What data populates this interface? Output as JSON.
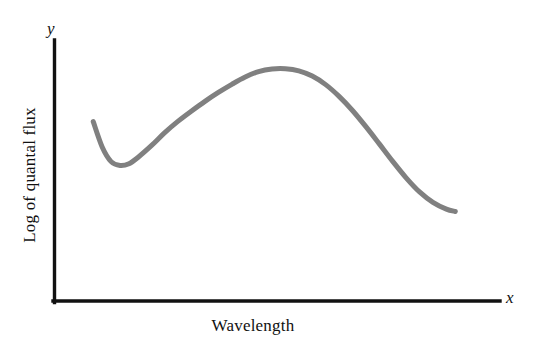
{
  "figure": {
    "background_color": "#ffffff",
    "axis_color": "#111111",
    "curve_color": "#808080"
  },
  "axes": {
    "y_variable": "y",
    "x_variable": "x"
  },
  "chart_data": {
    "type": "line",
    "title": "",
    "subtitle": "",
    "xlabel": "Wavelength",
    "ylabel": "Log of quantal flux",
    "xlim": [
      0,
      100
    ],
    "ylim": [
      0,
      100
    ],
    "grid": false,
    "legend": null,
    "axis_tick_labels": {
      "x": [],
      "y": []
    },
    "axis_variable_labels": {
      "x": "x",
      "y": "y"
    },
    "annotations": [],
    "series": [
      {
        "name": "Spectral quantal flux",
        "color": "#808080",
        "line_width": 5,
        "points": [
          {
            "x": 9.0,
            "y": 68.7
          },
          {
            "x": 11.0,
            "y": 59.0
          },
          {
            "x": 13.0,
            "y": 53.4
          },
          {
            "x": 15.0,
            "y": 51.9
          },
          {
            "x": 17.0,
            "y": 52.6
          },
          {
            "x": 19.0,
            "y": 55.0
          },
          {
            "x": 22.0,
            "y": 59.5
          },
          {
            "x": 25.0,
            "y": 64.5
          },
          {
            "x": 28.0,
            "y": 68.9
          },
          {
            "x": 31.0,
            "y": 72.8
          },
          {
            "x": 34.0,
            "y": 76.5
          },
          {
            "x": 37.0,
            "y": 79.9
          },
          {
            "x": 40.0,
            "y": 83.0
          },
          {
            "x": 43.0,
            "y": 85.8
          },
          {
            "x": 46.0,
            "y": 87.9
          },
          {
            "x": 49.0,
            "y": 88.9
          },
          {
            "x": 52.0,
            "y": 89.0
          },
          {
            "x": 55.0,
            "y": 88.2
          },
          {
            "x": 58.0,
            "y": 86.2
          },
          {
            "x": 61.0,
            "y": 82.9
          },
          {
            "x": 64.0,
            "y": 78.4
          },
          {
            "x": 67.0,
            "y": 73.0
          },
          {
            "x": 70.0,
            "y": 66.8
          },
          {
            "x": 73.0,
            "y": 60.2
          },
          {
            "x": 76.0,
            "y": 53.5
          },
          {
            "x": 79.0,
            "y": 47.2
          },
          {
            "x": 82.0,
            "y": 41.8
          },
          {
            "x": 85.0,
            "y": 37.8
          },
          {
            "x": 88.0,
            "y": 35.2
          },
          {
            "x": 90.0,
            "y": 34.3
          }
        ]
      }
    ]
  }
}
